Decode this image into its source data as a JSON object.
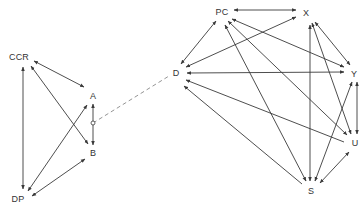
{
  "diagram": {
    "type": "directed-graph",
    "colors": {
      "edge": "#3a3a3a",
      "dashed": "#888888",
      "label": "#333333",
      "background": "#ffffff"
    },
    "nodes": [
      {
        "id": "CCR",
        "label": "CCR",
        "x": 19,
        "y": 57
      },
      {
        "id": "A",
        "label": "A",
        "x": 93,
        "y": 96
      },
      {
        "id": "B",
        "label": "B",
        "x": 93,
        "y": 153
      },
      {
        "id": "DP",
        "label": "DP",
        "x": 18,
        "y": 199
      },
      {
        "id": "D",
        "label": "D",
        "x": 176,
        "y": 73
      },
      {
        "id": "PC",
        "label": "PC",
        "x": 222,
        "y": 12
      },
      {
        "id": "X",
        "label": "X",
        "x": 306,
        "y": 13
      },
      {
        "id": "Y",
        "label": "Y",
        "x": 354,
        "y": 74
      },
      {
        "id": "U",
        "label": "U",
        "x": 355,
        "y": 143
      },
      {
        "id": "S",
        "label": "S",
        "x": 311,
        "y": 191
      }
    ],
    "edges": [
      {
        "from": "CCR",
        "to": "A",
        "x1": 34,
        "y1": 61,
        "x2": 84,
        "y2": 87,
        "start": true,
        "end": true
      },
      {
        "from": "CCR",
        "to": "B",
        "x1": 31,
        "y1": 66,
        "x2": 88,
        "y2": 144,
        "start": true,
        "end": true
      },
      {
        "from": "CCR",
        "to": "DP",
        "x1": 23,
        "y1": 67,
        "x2": 23,
        "y2": 189,
        "start": true,
        "end": true
      },
      {
        "from": "A",
        "to": "DP",
        "x1": 87,
        "y1": 105,
        "x2": 28,
        "y2": 191,
        "start": true,
        "end": true
      },
      {
        "from": "B",
        "to": "DP",
        "x1": 85,
        "y1": 159,
        "x2": 32,
        "y2": 196,
        "start": true,
        "end": true
      },
      {
        "from": "A",
        "to": "B",
        "x1": 93,
        "y1": 104,
        "x2": 93,
        "y2": 145,
        "start": true,
        "end": true
      },
      {
        "from": "PC",
        "to": "D",
        "x1": 216,
        "y1": 21,
        "x2": 181,
        "y2": 64,
        "start": true,
        "end": true
      },
      {
        "from": "PC",
        "to": "X",
        "x1": 234,
        "y1": 10,
        "x2": 296,
        "y2": 10,
        "start": true,
        "end": true
      },
      {
        "from": "X",
        "to": "D",
        "x1": 296,
        "y1": 17,
        "x2": 186,
        "y2": 67,
        "start": true,
        "end": true
      },
      {
        "from": "Y",
        "to": "D",
        "x1": 344,
        "y1": 72,
        "x2": 187,
        "y2": 73,
        "start": true,
        "end": true
      },
      {
        "from": "U",
        "to": "D",
        "x1": 344,
        "y1": 142,
        "x2": 186,
        "y2": 80,
        "start": false,
        "end": true
      },
      {
        "from": "S",
        "to": "D",
        "x1": 302,
        "y1": 184,
        "x2": 184,
        "y2": 86,
        "start": false,
        "end": true
      },
      {
        "from": "PC",
        "to": "Y",
        "x1": 232,
        "y1": 19,
        "x2": 344,
        "y2": 67,
        "start": true,
        "end": true
      },
      {
        "from": "PC",
        "to": "U",
        "x1": 228,
        "y1": 21,
        "x2": 347,
        "y2": 135,
        "start": true,
        "end": true
      },
      {
        "from": "PC",
        "to": "S",
        "x1": 225,
        "y1": 25,
        "x2": 306,
        "y2": 181,
        "start": true,
        "end": true
      },
      {
        "from": "X",
        "to": "S",
        "x1": 310,
        "y1": 25,
        "x2": 310,
        "y2": 181,
        "start": true,
        "end": true
      },
      {
        "from": "X",
        "to": "U",
        "x1": 312,
        "y1": 23,
        "x2": 351,
        "y2": 134,
        "start": true,
        "end": true
      },
      {
        "from": "X",
        "to": "Y",
        "x1": 315,
        "y1": 22,
        "x2": 350,
        "y2": 65,
        "start": true,
        "end": true
      },
      {
        "from": "Y",
        "to": "U",
        "x1": 357,
        "y1": 82,
        "x2": 357,
        "y2": 134,
        "start": true,
        "end": true
      },
      {
        "from": "Y",
        "to": "S",
        "x1": 352,
        "y1": 82,
        "x2": 315,
        "y2": 181,
        "start": true,
        "end": true
      },
      {
        "from": "U",
        "to": "S",
        "x1": 349,
        "y1": 152,
        "x2": 320,
        "y2": 183,
        "start": true,
        "end": true
      }
    ],
    "connector": {
      "from_x": 93,
      "from_y": 123,
      "to_x": 169,
      "to_y": 76,
      "style": "dashed",
      "circle_r": 2
    }
  }
}
